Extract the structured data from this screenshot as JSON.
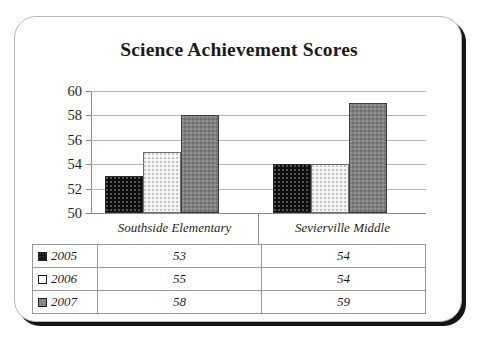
{
  "card": {
    "title": "Science Achievement Scores"
  },
  "chart_data": {
    "type": "bar",
    "title": "Science Achievement Scores",
    "xlabel": "",
    "ylabel": "",
    "ylim": [
      50,
      60
    ],
    "yticks": [
      50,
      52,
      54,
      56,
      58,
      60
    ],
    "grid": true,
    "legend_position": "table-below",
    "categories": [
      "Southside Elementary",
      "Sevierville Middle"
    ],
    "series": [
      {
        "name": "2005",
        "values": [
          53,
          54
        ],
        "color": "#0d0d0d",
        "pattern": "dotted-dark"
      },
      {
        "name": "2006",
        "values": [
          55,
          54
        ],
        "color": "#f4f4f2",
        "pattern": "dotted-light"
      },
      {
        "name": "2007",
        "values": [
          58,
          59
        ],
        "color": "#808080",
        "pattern": "dotted-gray"
      }
    ]
  },
  "table": {
    "rows": [
      {
        "year": "2005",
        "swatch": "black-swatch",
        "values": [
          "53",
          "54"
        ]
      },
      {
        "year": "2006",
        "swatch": "white-swatch",
        "values": [
          "55",
          "54"
        ]
      },
      {
        "year": "2007",
        "swatch": "gray-swatch",
        "values": [
          "58",
          "59"
        ]
      }
    ]
  }
}
